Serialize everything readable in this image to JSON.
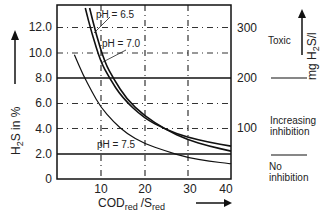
{
  "chart_data": {
    "type": "line",
    "title": "",
    "xlabel": "COD_red / S_red",
    "ylabel": "H2S in %",
    "y2label": "mg H2S/l",
    "xlim": [
      0,
      40
    ],
    "ylim": [
      0,
      13.8
    ],
    "x_ticks": [
      "10",
      "20",
      "30",
      "40"
    ],
    "y_ticks": [
      "0",
      "2.0",
      "4.0",
      "6.0",
      "8.0",
      "10.0",
      "12.0"
    ],
    "y2_ticks": [
      "100",
      "200",
      "300"
    ],
    "grid": true,
    "series": [
      {
        "name": "pH = 6.5",
        "x": [
          6.5,
          8,
          10,
          12,
          15,
          20,
          25,
          30,
          35,
          40
        ],
        "y": [
          13.5,
          11.5,
          9.3,
          8.0,
          6.4,
          4.8,
          3.9,
          3.3,
          2.9,
          2.6
        ]
      },
      {
        "name": "pH = 7.0",
        "x": [
          7.5,
          9,
          11,
          13,
          16,
          20,
          25,
          30,
          35,
          40
        ],
        "y": [
          13.5,
          11.4,
          9.2,
          7.9,
          6.3,
          5.0,
          3.9,
          3.1,
          2.6,
          2.2
        ]
      },
      {
        "name": "pH = 7.5",
        "x": [
          4,
          6,
          8,
          10,
          13,
          16,
          20,
          25,
          30,
          35,
          40
        ],
        "y": [
          9.8,
          8.2,
          6.9,
          5.7,
          4.5,
          3.6,
          2.8,
          2.2,
          1.7,
          1.4,
          1.2
        ]
      }
    ],
    "horizontal_lines": [
      {
        "y": 8.0,
        "style": "solid",
        "meaning": "Toxic threshold (200 mg H2S/l)"
      },
      {
        "y": 2.0,
        "style": "solid",
        "meaning": "No inhibition threshold"
      }
    ],
    "annotations": [
      {
        "text": "Toxic",
        "region": "above 200"
      },
      {
        "text": "Increasing inhibition",
        "region": "between 200 and no inhibition line"
      },
      {
        "text": "No inhibition",
        "region": "below"
      }
    ]
  },
  "labels": {
    "ylabel_main": "H",
    "ylabel_sub": "2",
    "ylabel_rest": "S in %",
    "y2label_main": "mg H",
    "y2label_sub": "2",
    "y2label_rest": "S/l",
    "xlabel_main": "COD",
    "xlabel_sub1": "red",
    "xlabel_mid": "/S",
    "xlabel_sub2": "red",
    "series_labels": [
      "pH = 6.5",
      "pH = 7.0",
      "pH = 7.5"
    ],
    "zone_toxic": "Toxic",
    "zone_increasing_1": "Increasing",
    "zone_increasing_2": "inhibition",
    "zone_no_1": "No",
    "zone_no_2": "inhibition"
  }
}
